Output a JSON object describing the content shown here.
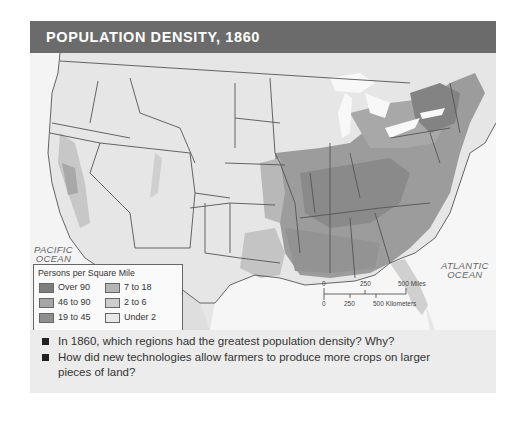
{
  "title": "POPULATION DENSITY, 1860",
  "map": {
    "ocean_labels": [
      {
        "line1": "PACIFIC",
        "line2": "OCEAN"
      },
      {
        "line1": "ATLANTIC",
        "line2": "OCEAN"
      }
    ],
    "colors": {
      "title_bar": "#6b6b6b",
      "water": "#ffffff",
      "land_base": "#e2e2e2",
      "border": "#555555"
    }
  },
  "legend": {
    "title": "Persons per Square Mile",
    "items": [
      {
        "label": "Over 90",
        "color": "#7d7d7d"
      },
      {
        "label": "46 to 90",
        "color": "#a6a6a6"
      },
      {
        "label": "19 to 45",
        "color": "#8f8f8f"
      },
      {
        "label": "7 to 18",
        "color": "#b5b5b5"
      },
      {
        "label": "2 to 6",
        "color": "#cdcdcd"
      },
      {
        "label": "Under 2",
        "color": "#e8e8e8"
      }
    ]
  },
  "scale": {
    "miles_0": "0",
    "miles_250": "250",
    "miles_500": "500 Miles",
    "km_0": "0",
    "km_250": "250",
    "km_500": "500 Kilometers"
  },
  "questions": [
    "In 1860, which regions had the greatest population density? Why?",
    "How did new technologies allow farmers to produce more crops on larger pieces of land?"
  ]
}
